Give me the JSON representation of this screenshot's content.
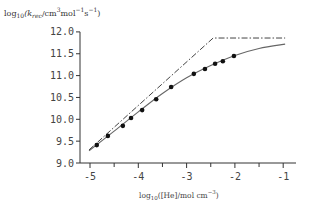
{
  "chart_data": {
    "type": "line",
    "title": "",
    "xlabel": "log10([He]/mol cm^-3)",
    "ylabel": "log10(k_rec/cm^3 mol^-1 s^-1)",
    "xlim": [
      -5.2,
      -0.9
    ],
    "ylim": [
      9.0,
      12.0
    ],
    "grid": false,
    "legend": null,
    "x_ticks": [
      -5,
      -4,
      -3,
      -2,
      -1
    ],
    "x_tick_labels": [
      "-5",
      "-4",
      "-3",
      "-2",
      "-1"
    ],
    "y_ticks": [
      9.0,
      9.5,
      10.0,
      10.5,
      11.0,
      11.5,
      12.0
    ],
    "y_tick_labels": [
      "9.0",
      "9.5",
      "10.0",
      "10.5",
      "11.0",
      "11.5",
      "12.0"
    ],
    "series": [
      {
        "name": "experimental data",
        "style": "scatter-filled-circle",
        "color": "#111111",
        "x": [
          -4.86,
          -4.63,
          -4.32,
          -4.15,
          -3.92,
          -3.63,
          -3.32,
          -2.85,
          -2.62,
          -2.41,
          -2.25,
          -2.02
        ],
        "y": [
          9.41,
          9.62,
          9.85,
          10.03,
          10.21,
          10.46,
          10.74,
          11.04,
          11.15,
          11.27,
          11.33,
          11.45
        ]
      },
      {
        "name": "fall-off curve (fit)",
        "style": "solid",
        "color": "#666666",
        "x": [
          -5.02,
          -4.5,
          -4.0,
          -3.5,
          -3.0,
          -2.5,
          -2.0,
          -1.5,
          -0.96
        ],
        "y": [
          9.28,
          9.73,
          10.17,
          10.59,
          10.95,
          11.23,
          11.46,
          11.62,
          11.72
        ]
      },
      {
        "name": "low/high-pressure limits",
        "style": "dash-dot",
        "color": "#444444",
        "x": [
          -5.02,
          -2.45,
          -0.96
        ],
        "y": [
          9.3,
          11.86,
          11.86
        ]
      }
    ]
  },
  "labels": {
    "y_axis_html_prefix": "log",
    "y_axis_sub": "10",
    "y_axis_body": "(k",
    "y_axis_k_sub": "rec",
    "y_axis_units": "/cm",
    "y_axis_cm_sup": "3",
    "y_axis_mol": "mol",
    "y_axis_mol_sup": "−1",
    "y_axis_s": "s",
    "y_axis_s_sup": "−1",
    "y_axis_close": ")",
    "x_axis_prefix": "log",
    "x_axis_sub": "10",
    "x_axis_body": "([He]/mol cm",
    "x_axis_sup": "−3",
    "x_axis_close": ")"
  }
}
